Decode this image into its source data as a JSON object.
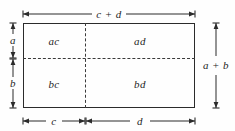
{
  "figure": {
    "background_color": "#fefefe",
    "line_color": "#2b2b2b",
    "dash_color": "#3a3a3a",
    "text_color": "#1f1f1f"
  },
  "cells": {
    "top_left": "ac",
    "top_right": "ad",
    "bottom_left": "bc",
    "bottom_right": "bd"
  },
  "dimensions": {
    "top": "c + d",
    "right": "a + b",
    "left_upper": "a",
    "left_lower": "b",
    "bottom_left": "c",
    "bottom_right": "d"
  }
}
